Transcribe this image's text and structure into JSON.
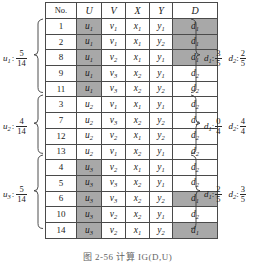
{
  "figure": {
    "caption": "图 2-56  计算 IG(D,U)",
    "colors": {
      "shade": "#a8a8a8",
      "border": "#4a4a4a",
      "background": "#ffffff"
    }
  },
  "table": {
    "headers": [
      "No.",
      "U",
      "V",
      "X",
      "Y",
      "D"
    ],
    "rows": [
      {
        "no": "1",
        "u": {
          "base": "u",
          "sub": "1"
        },
        "v": {
          "base": "v",
          "sub": "1"
        },
        "x": {
          "base": "x",
          "sub": "1"
        },
        "y": {
          "base": "y",
          "sub": "1"
        },
        "d": {
          "base": "d",
          "sub": "1"
        },
        "u_shaded": true,
        "d_shaded": true
      },
      {
        "no": "2",
        "u": {
          "base": "u",
          "sub": "1"
        },
        "v": {
          "base": "v",
          "sub": "1"
        },
        "x": {
          "base": "x",
          "sub": "1"
        },
        "y": {
          "base": "y",
          "sub": "2"
        },
        "d": {
          "base": "d",
          "sub": "1"
        },
        "u_shaded": true,
        "d_shaded": true
      },
      {
        "no": "8",
        "u": {
          "base": "u",
          "sub": "1"
        },
        "v": {
          "base": "v",
          "sub": "2"
        },
        "x": {
          "base": "x",
          "sub": "1"
        },
        "y": {
          "base": "y",
          "sub": "1"
        },
        "d": {
          "base": "d",
          "sub": "1"
        },
        "u_shaded": true,
        "d_shaded": true
      },
      {
        "no": "9",
        "u": {
          "base": "u",
          "sub": "1"
        },
        "v": {
          "base": "v",
          "sub": "3"
        },
        "x": {
          "base": "x",
          "sub": "2"
        },
        "y": {
          "base": "y",
          "sub": "1"
        },
        "d": {
          "base": "d",
          "sub": "2"
        },
        "u_shaded": true,
        "d_shaded": false
      },
      {
        "no": "11",
        "u": {
          "base": "u",
          "sub": "1"
        },
        "v": {
          "base": "v",
          "sub": "3"
        },
        "x": {
          "base": "x",
          "sub": "2"
        },
        "y": {
          "base": "y",
          "sub": "2"
        },
        "d": {
          "base": "d",
          "sub": "2"
        },
        "u_shaded": true,
        "d_shaded": false
      },
      {
        "no": "3",
        "u": {
          "base": "u",
          "sub": "2"
        },
        "v": {
          "base": "v",
          "sub": "1"
        },
        "x": {
          "base": "x",
          "sub": "1"
        },
        "y": {
          "base": "y",
          "sub": "1"
        },
        "d": {
          "base": "d",
          "sub": "2"
        },
        "u_shaded": false,
        "d_shaded": false
      },
      {
        "no": "7",
        "u": {
          "base": "u",
          "sub": "2"
        },
        "v": {
          "base": "v",
          "sub": "3"
        },
        "x": {
          "base": "x",
          "sub": "2"
        },
        "y": {
          "base": "y",
          "sub": "2"
        },
        "d": {
          "base": "d",
          "sub": "2"
        },
        "u_shaded": false,
        "d_shaded": false
      },
      {
        "no": "12",
        "u": {
          "base": "u",
          "sub": "2"
        },
        "v": {
          "base": "v",
          "sub": "2"
        },
        "x": {
          "base": "x",
          "sub": "1"
        },
        "y": {
          "base": "y",
          "sub": "2"
        },
        "d": {
          "base": "d",
          "sub": "2"
        },
        "u_shaded": false,
        "d_shaded": false
      },
      {
        "no": "13",
        "u": {
          "base": "u",
          "sub": "2"
        },
        "v": {
          "base": "v",
          "sub": "1"
        },
        "x": {
          "base": "x",
          "sub": "2"
        },
        "y": {
          "base": "y",
          "sub": "1"
        },
        "d": {
          "base": "d",
          "sub": "2"
        },
        "u_shaded": false,
        "d_shaded": false
      },
      {
        "no": "4",
        "u": {
          "base": "u",
          "sub": "3"
        },
        "v": {
          "base": "v",
          "sub": "2"
        },
        "x": {
          "base": "x",
          "sub": "1"
        },
        "y": {
          "base": "y",
          "sub": "1"
        },
        "d": {
          "base": "d",
          "sub": "2"
        },
        "u_shaded": true,
        "d_shaded": false
      },
      {
        "no": "5",
        "u": {
          "base": "u",
          "sub": "3"
        },
        "v": {
          "base": "v",
          "sub": "3"
        },
        "x": {
          "base": "x",
          "sub": "2"
        },
        "y": {
          "base": "y",
          "sub": "1"
        },
        "d": {
          "base": "d",
          "sub": "2"
        },
        "u_shaded": true,
        "d_shaded": false
      },
      {
        "no": "6",
        "u": {
          "base": "u",
          "sub": "3"
        },
        "v": {
          "base": "v",
          "sub": "3"
        },
        "x": {
          "base": "x",
          "sub": "2"
        },
        "y": {
          "base": "y",
          "sub": "2"
        },
        "d": {
          "base": "d",
          "sub": "1"
        },
        "u_shaded": true,
        "d_shaded": true
      },
      {
        "no": "10",
        "u": {
          "base": "u",
          "sub": "3"
        },
        "v": {
          "base": "v",
          "sub": "2"
        },
        "x": {
          "base": "x",
          "sub": "2"
        },
        "y": {
          "base": "y",
          "sub": "1"
        },
        "d": {
          "base": "d",
          "sub": "2"
        },
        "u_shaded": true,
        "d_shaded": false
      },
      {
        "no": "14",
        "u": {
          "base": "u",
          "sub": "3"
        },
        "v": {
          "base": "v",
          "sub": "2"
        },
        "x": {
          "base": "x",
          "sub": "1"
        },
        "y": {
          "base": "y",
          "sub": "2"
        },
        "d": {
          "base": "d",
          "sub": "1"
        },
        "u_shaded": true,
        "d_shaded": true
      }
    ]
  },
  "groups": [
    {
      "left": {
        "label_base": "u",
        "label_sub": "1",
        "num": "5",
        "den": "14"
      },
      "right": [
        {
          "label_base": "d",
          "label_sub": "1",
          "num": "3",
          "den": "5"
        },
        {
          "label_base": "d",
          "label_sub": "2",
          "num": "2",
          "den": "5"
        }
      ]
    },
    {
      "left": {
        "label_base": "u",
        "label_sub": "2",
        "num": "4",
        "den": "14"
      },
      "right": [
        {
          "label_base": "d",
          "label_sub": "1",
          "num": "0",
          "den": "4"
        },
        {
          "label_base": "d",
          "label_sub": "2",
          "num": "4",
          "den": "4"
        }
      ]
    },
    {
      "left": {
        "label_base": "u",
        "label_sub": "3",
        "num": "5",
        "den": "14"
      },
      "right": [
        {
          "label_base": "d",
          "label_sub": "1",
          "num": "2",
          "den": "5"
        },
        {
          "label_base": "d",
          "label_sub": "2",
          "num": "3",
          "den": "5"
        }
      ]
    }
  ]
}
